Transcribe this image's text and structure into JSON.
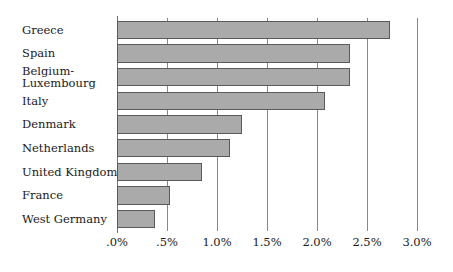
{
  "chart_data": {
    "type": "bar",
    "orientation": "horizontal",
    "title": "",
    "subtitle": "",
    "xlabel": "",
    "ylabel": "",
    "xlim": [
      0,
      3.0
    ],
    "grid": true,
    "legend": null,
    "categories": [
      "Greece",
      "Spain",
      "Belgium-\nLuxembourg",
      "Italy",
      "Denmark",
      "Netherlands",
      "United Kingdom",
      "France",
      "West Germany"
    ],
    "category_labels": [
      {
        "line1": "Greece",
        "line2": ""
      },
      {
        "line1": "Spain",
        "line2": ""
      },
      {
        "line1": "Belgium-",
        "line2": "Luxembourg"
      },
      {
        "line1": "Italy",
        "line2": ""
      },
      {
        "line1": "Denmark",
        "line2": ""
      },
      {
        "line1": "Netherlands",
        "line2": ""
      },
      {
        "line1": "United Kingdom",
        "line2": ""
      },
      {
        "line1": "France",
        "line2": ""
      },
      {
        "line1": "West Germany",
        "line2": ""
      }
    ],
    "values": [
      2.73,
      2.33,
      2.33,
      2.08,
      1.25,
      1.13,
      0.85,
      0.53,
      0.38
    ],
    "value_unit": "%",
    "xticks": [
      0,
      0.5,
      1.0,
      1.5,
      2.0,
      2.5,
      3.0
    ],
    "xticklabels": [
      ".0%",
      ".5%",
      "1.0%",
      "1.5%",
      "2.0%",
      "2.5%",
      "3.0%"
    ],
    "colors": {
      "bar_fill": "#aaaaaa",
      "bar_border": "#5a5a5a",
      "gridline": "#888888",
      "axis": "#6f6f6f",
      "text": "#1a1a1a",
      "background": "#ffffff"
    }
  }
}
